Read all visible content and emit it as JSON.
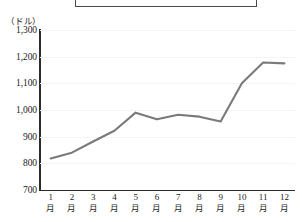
{
  "title_box": {
    "visible_text": "",
    "note": "bordered box at top, contents cropped above image edge"
  },
  "axis": {
    "unit_label": "（ドル）",
    "y_ticks": [
      "1,300",
      "1,200",
      "1,100",
      "1,000",
      "900",
      "800",
      "700"
    ],
    "x_tick_numbers": [
      "1",
      "2",
      "3",
      "4",
      "5",
      "6",
      "7",
      "8",
      "9",
      "10",
      "11",
      "12"
    ],
    "x_tick_suffix": "月"
  },
  "colors": {
    "line": "#7a7a7a",
    "axis": "#2b2b2b",
    "grid": "#f2f4f7",
    "box_border": "#4a4a4a",
    "background": "#ffffff"
  },
  "chart_data": {
    "type": "line",
    "title": "",
    "xlabel": "",
    "ylabel": "（ドル）",
    "categories": [
      "1月",
      "2月",
      "3月",
      "4月",
      "5月",
      "6月",
      "7月",
      "8月",
      "9月",
      "10月",
      "11月",
      "12月"
    ],
    "values": [
      818,
      840,
      882,
      922,
      990,
      965,
      982,
      975,
      957,
      1100,
      1178,
      1175
    ],
    "ylim": [
      700,
      1300
    ],
    "ytick_values": [
      700,
      800,
      900,
      1000,
      1100,
      1200,
      1300
    ],
    "grid": true,
    "legend": "none",
    "markers": false,
    "series": [
      {
        "name": "",
        "values": [
          818,
          840,
          882,
          922,
          990,
          965,
          982,
          975,
          957,
          1100,
          1178,
          1175
        ]
      }
    ]
  }
}
